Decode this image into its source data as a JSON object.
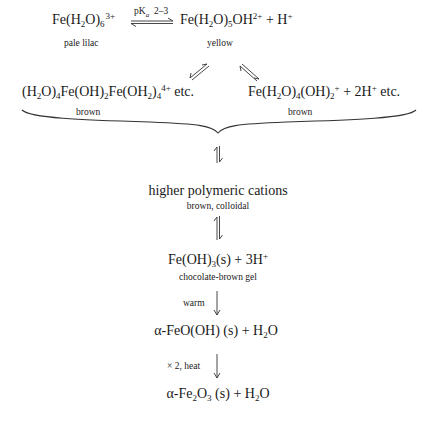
{
  "diagram": {
    "nodes": {
      "hexaaqua": {
        "species": "Fe(H2O)6 3+",
        "label": "pale lilac"
      },
      "equilibrium": {
        "condition_pKa_label": "pK",
        "condition_pKa_sub": "a",
        "condition_value": "2–3"
      },
      "pentaaqua": {
        "species": "Fe(H2O)5OH2+ + H+",
        "label": "yellow"
      },
      "dimer": {
        "species": "(H2O)4Fe(OH)2Fe(OH2)4 4+ etc.",
        "label": "brown"
      },
      "tetraaqua": {
        "species": "Fe(H2O)4(OH)2+ + 2H+ etc.",
        "label": "brown"
      },
      "polymeric": {
        "species": "higher polymeric cations",
        "label": "brown, colloidal"
      },
      "hydroxide": {
        "species": "Fe(OH)3(s) + 3H+",
        "label": "chocolate-brown gel"
      },
      "goethite": {
        "species": "α-FeO(OH) (s) + H2O",
        "condition": "warm"
      },
      "hematite": {
        "species": "α-Fe2O3 (s) + H2O",
        "condition": "× 2, heat"
      }
    },
    "text": {
      "etc": "etc.",
      "plus": "+",
      "polymeric": "higher polymeric cations",
      "alpha": "α",
      "s": "(s)"
    }
  }
}
